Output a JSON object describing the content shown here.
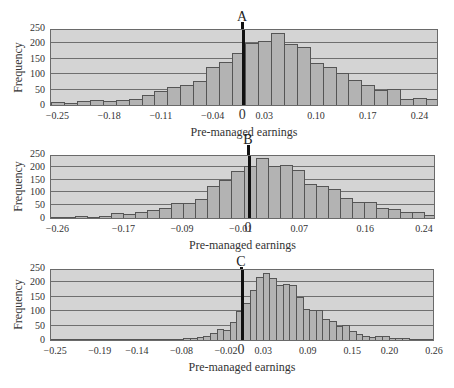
{
  "chart_data": [
    {
      "type": "bar",
      "title": "A",
      "xlabel": "Pre-managed earnings",
      "ylabel": "Frequency",
      "ylim": [
        0,
        250
      ],
      "yticks": [
        "250",
        "200",
        "150",
        "100",
        "50",
        "0"
      ],
      "xticks": [
        "−0.25",
        "−0.18",
        "−0.11",
        "−0.04",
        "0",
        "0.03",
        "0.10",
        "0.17",
        "0.24"
      ],
      "xrange": [
        -0.26,
        0.265
      ],
      "bin_width": 0.0175,
      "grid": true,
      "values": [
        10,
        8,
        13,
        16,
        12,
        16,
        20,
        32,
        45,
        60,
        65,
        78,
        122,
        140,
        170,
        202,
        207,
        235,
        197,
        187,
        137,
        125,
        103,
        82,
        65,
        50,
        52,
        20,
        22,
        18
      ]
    },
    {
      "type": "bar",
      "title": "B",
      "xlabel": "Pre-managed earnings",
      "ylabel": "Frequency",
      "ylim": [
        0,
        250
      ],
      "yticks": [
        "250",
        "200",
        "150",
        "100",
        "50",
        "0"
      ],
      "xticks": [
        "−0.26",
        "−0.17",
        "−0.09",
        "−0.01",
        "0",
        "0.07",
        "0.16",
        "0.24"
      ],
      "xrange": [
        -0.27,
        0.255
      ],
      "bin_width": 0.0164,
      "grid": true,
      "values": [
        3,
        5,
        7,
        5,
        8,
        21,
        17,
        22,
        32,
        40,
        60,
        57,
        75,
        127,
        150,
        185,
        205,
        233,
        202,
        208,
        187,
        132,
        125,
        112,
        80,
        62,
        63,
        40,
        36,
        25,
        23,
        12
      ]
    },
    {
      "type": "bar",
      "title": "C",
      "xlabel": "Pre-managed earnings",
      "ylabel": "Frequency",
      "ylim": [
        0,
        250
      ],
      "yticks": [
        "250",
        "200",
        "150",
        "100",
        "50",
        "0"
      ],
      "xticks": [
        "−0.25",
        "−0.19",
        "−0.14",
        "−0.08",
        "−0.02",
        "0",
        "0.03",
        "0.09",
        "0.15",
        "0.20",
        "0.26"
      ],
      "xrange": [
        -0.257,
        0.26
      ],
      "bin_width": 0.0095,
      "grid": true,
      "values": [
        1,
        1,
        1,
        1,
        1,
        1,
        1,
        1,
        1,
        1,
        1,
        2,
        1,
        1,
        2,
        2,
        3,
        3,
        4,
        5,
        6,
        7,
        10,
        15,
        23,
        37,
        34,
        62,
        100,
        130,
        175,
        220,
        233,
        215,
        190,
        195,
        192,
        150,
        107,
        103,
        103,
        72,
        65,
        48,
        53,
        30,
        22,
        15,
        10,
        15,
        14,
        6,
        7,
        8,
        4,
        4,
        3,
        2
      ]
    }
  ]
}
